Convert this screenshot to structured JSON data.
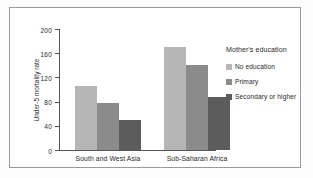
{
  "chart_data": {
    "type": "bar",
    "title": "",
    "xlabel": "",
    "ylabel": "Under-5 mortality rate",
    "categories": [
      "South and West Asia",
      "Sub-Saharan Africa"
    ],
    "series": [
      {
        "name": "No education",
        "values": [
          105,
          170
        ],
        "color": "#b6b6b6"
      },
      {
        "name": "Primary",
        "values": [
          78,
          140
        ],
        "color": "#8b8b8b"
      },
      {
        "name": "Secondary or higher",
        "values": [
          50,
          88
        ],
        "color": "#5c5c5c"
      }
    ],
    "ylim": [
      0,
      200
    ],
    "yticks": [
      0,
      40,
      80,
      120,
      160,
      200
    ],
    "ytick_labels": [
      "0",
      "40",
      "80",
      "120",
      "160",
      "200"
    ],
    "grid": false,
    "legend_position": "right",
    "legend_title": "Mother's education"
  },
  "axis": {
    "line_color": "#555555",
    "text_color": "#2a2a2a"
  },
  "frame": {
    "border_color": "#9a9a9a",
    "background": "#ffffff"
  }
}
